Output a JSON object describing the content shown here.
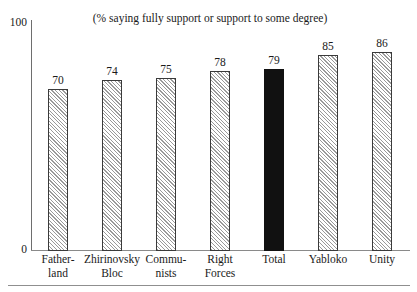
{
  "chart_data": {
    "type": "bar",
    "title": "(% saying fully support or support to some degree)",
    "xlabel": "",
    "ylabel": "",
    "ylim": [
      0,
      100
    ],
    "y_ticks": [
      "0",
      "100"
    ],
    "grid": false,
    "legend": "none",
    "categories": [
      "Father-land",
      "Zhirinovsky Bloc",
      "Commu-nists",
      "Right Forces",
      "Total",
      "Yabloko",
      "Unity"
    ],
    "category_lines": [
      [
        "Father-",
        "land"
      ],
      [
        "Zhirinovsky",
        "Bloc"
      ],
      [
        "Commu-",
        "nists"
      ],
      [
        "Right",
        "Forces"
      ],
      [
        "Total",
        ""
      ],
      [
        "Yabloko",
        ""
      ],
      [
        "Unity",
        ""
      ]
    ],
    "values": [
      70,
      74,
      75,
      78,
      79,
      85,
      86
    ],
    "value_labels": [
      "70",
      "74",
      "75",
      "78",
      "79",
      "85",
      "86"
    ],
    "bar_styles": [
      "hatched",
      "hatched",
      "hatched",
      "hatched",
      "solid",
      "hatched",
      "hatched"
    ],
    "colors": {
      "hatch_line": "#9a9a9a",
      "hatch_background": "#ffffff",
      "bar_border": "#3a3a3a",
      "solid_bar": "#111111",
      "axis": "#8a8a8a",
      "text": "#1a1a1a"
    }
  }
}
